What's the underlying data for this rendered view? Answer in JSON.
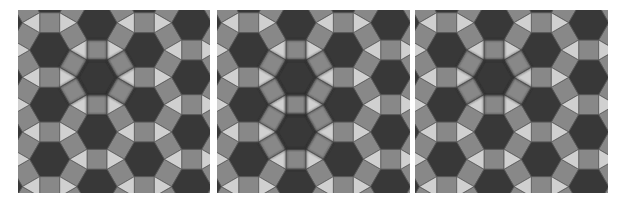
{
  "figure": {
    "width": 626,
    "height": 204,
    "background": "#ffffff",
    "tiling": {
      "name": "rhombitrihexagonal (3.4.6.4)",
      "edge": 20,
      "origin": [
        31.7,
        40
      ],
      "v1": [
        0,
        54.64
      ],
      "v2": [
        47.32,
        27.32
      ],
      "colors": {
        "hexagon": "#383838",
        "square": "#888888",
        "triangle": "#d0d0d0",
        "edge": "#5a5a5a",
        "highlight": "#2a2a2a"
      }
    },
    "panels": [
      {
        "id": "panel-1",
        "x": 18,
        "y": 10,
        "w": 192,
        "h": 183,
        "highlight_hexes": [
          [
            0,
            1
          ]
        ]
      },
      {
        "id": "panel-2",
        "x": 217,
        "y": 10,
        "w": 193,
        "h": 183,
        "highlight_hexes": [
          [
            0,
            1
          ],
          [
            1,
            1
          ]
        ]
      },
      {
        "id": "panel-3",
        "x": 415,
        "y": 10,
        "w": 193,
        "h": 183,
        "highlight_hexes": [
          [
            0,
            1
          ]
        ]
      }
    ]
  }
}
